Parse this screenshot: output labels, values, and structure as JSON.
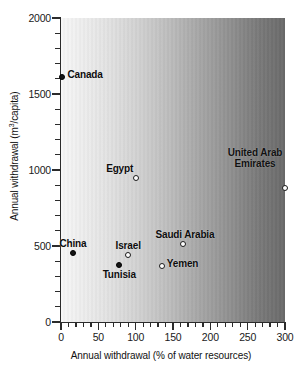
{
  "chart_data": {
    "type": "scatter",
    "title": "",
    "xlabel": "Annual withdrawal  (% of water resources)",
    "ylabel_prefix": "Annual withdrawal (m",
    "ylabel_sup": "3",
    "ylabel_suffix": "/capita)",
    "ylabel_plain": "Annual withdrawal (m3/capita)",
    "xlim": [
      0,
      300
    ],
    "ylim": [
      0,
      2000
    ],
    "x_major_ticks": [
      0,
      50,
      100,
      150,
      200,
      250,
      300
    ],
    "x_minor_step": 10,
    "y_major_ticks": [
      0,
      500,
      1000,
      1500,
      2000
    ],
    "y_minor_step": 100,
    "x_tick_labels": [
      "0",
      "50",
      "100",
      "150",
      "200",
      "250",
      "300"
    ],
    "y_tick_labels": [
      "0",
      "500",
      "1000",
      "1500",
      "2000"
    ],
    "grid": false,
    "legend": "none",
    "background": "horizontal grayscale gradient, light at left to dark at right",
    "marker_styles": {
      "filled": "solid black circle",
      "open": "white circle with black outline"
    },
    "points": [
      {
        "name": "Canada",
        "x": 2,
        "y": 1610,
        "marker": "filled",
        "label_pos": "right"
      },
      {
        "name": "Egypt",
        "x": 100,
        "y": 945,
        "marker": "open",
        "label_pos": "above-left"
      },
      {
        "name": "United Arab Emirates",
        "x": 300,
        "y": 880,
        "marker": "open",
        "label_pos": "above-left-multiline"
      },
      {
        "name": "China",
        "x": 16,
        "y": 455,
        "marker": "filled",
        "label_pos": "above"
      },
      {
        "name": "Israel",
        "x": 90,
        "y": 440,
        "marker": "open",
        "label_pos": "above"
      },
      {
        "name": "Tunisia",
        "x": 78,
        "y": 375,
        "marker": "filled",
        "label_pos": "below"
      },
      {
        "name": "Saudi Arabia",
        "x": 164,
        "y": 510,
        "marker": "open",
        "label_pos": "above"
      },
      {
        "name": "Yemen",
        "x": 135,
        "y": 370,
        "marker": "open",
        "label_pos": "right"
      }
    ]
  }
}
